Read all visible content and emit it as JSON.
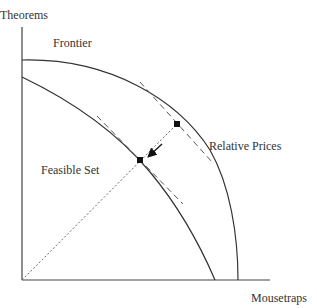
{
  "diagram": {
    "type": "production-possibility-frontier",
    "axes": {
      "y_label": "Theorems",
      "x_label": "Mousetraps"
    },
    "labels": {
      "frontier": "Frontier",
      "feasible_set": "Feasible Set",
      "relative_prices": "Relative Prices"
    },
    "curves": [
      {
        "name": "frontier",
        "description": "outer concave curve"
      },
      {
        "name": "feasible-set-boundary",
        "description": "inner concave curve"
      }
    ],
    "elements": {
      "points": 2,
      "tangent_lines": 2,
      "ray_from_origin": "dotted",
      "arrow": "points from outer point toward inner point"
    },
    "colors": {
      "line": "#333333",
      "dashed": "#555555",
      "dot": "#111111"
    }
  }
}
